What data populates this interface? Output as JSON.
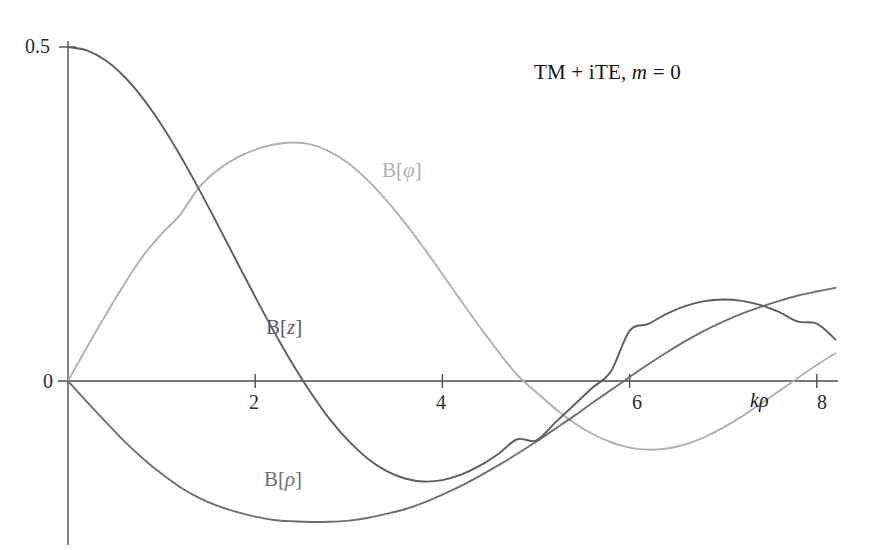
{
  "chart_data": {
    "type": "line",
    "title": "TM + iTE, m = 0",
    "title_parts": {
      "prefix": "TM + iTE,",
      "symbol": "m",
      "equals": "= 0"
    },
    "xlabel": "kρ",
    "ylabel": "",
    "xlim": [
      -0.12,
      8.2
    ],
    "ylim": [
      -0.255,
      0.52
    ],
    "grid": false,
    "legend": "inline-curve-labels",
    "x_ticks": [
      2,
      4,
      6,
      8
    ],
    "x_tick_labels": [
      "2",
      "4",
      "6",
      "8"
    ],
    "y_ticks": [
      0,
      0.5
    ],
    "y_tick_labels": [
      "0",
      "0.5"
    ],
    "x": [
      0,
      0.2,
      0.4,
      0.6,
      0.8,
      1,
      1.2,
      1.4,
      1.6,
      1.8,
      2,
      2.2,
      2.4,
      2.6,
      2.8,
      3,
      3.2,
      3.4,
      3.6,
      3.8,
      4,
      4.2,
      4.4,
      4.6,
      4.8,
      5,
      5.2,
      5.4,
      5.6,
      5.8,
      6,
      6.2,
      6.4,
      6.6,
      6.8,
      7,
      7.2,
      7.4,
      7.6,
      7.8,
      8,
      8.2
    ],
    "series": [
      {
        "name": "B[z]",
        "symbol": "z",
        "color": "#5d5d5d",
        "label_x": 3.05,
        "label_y": 0.105,
        "description": "0.5*J0(k rho)",
        "values": [
          0.5,
          0.495,
          0.4801,
          0.4558,
          0.4231,
          0.3831,
          0.3372,
          0.2869,
          0.2338,
          0.1797,
          0.126,
          0.0742,
          0.0255,
          -0.0187,
          -0.0577,
          -0.0901,
          -0.1159,
          -0.1345,
          -0.146,
          -0.1505,
          -0.1484,
          -0.1403,
          -0.1268,
          -0.1088,
          -0.0872,
          -0.0891,
          -0.063,
          -0.0367,
          -0.0105,
          0.0144,
          0.0751,
          0.0855,
          0.101,
          0.1125,
          0.1196,
          0.1221,
          0.12,
          0.1135,
          0.103,
          0.0888,
          0.0858,
          0.062
        ]
      },
      {
        "name": "B[φ]",
        "symbol": "φ",
        "color": "#b0b0b0",
        "label_x": 3.6,
        "label_y": 0.285,
        "description": "0.5*J1(k rho), peak ~0.357 at k rho ~1.84",
        "values": [
          0,
          0.0499,
          0.0985,
          0.1446,
          0.1869,
          0.2203,
          0.2492,
          0.2898,
          0.316,
          0.334,
          0.3464,
          0.354,
          0.357,
          0.3539,
          0.343,
          0.3256,
          0.3007,
          0.2708,
          0.2366,
          0.1992,
          0.16,
          0.12,
          0.0808,
          0.0435,
          0.009,
          -0.0164,
          -0.0408,
          -0.062,
          -0.079,
          -0.0917,
          -0.0997,
          -0.1028,
          -0.101,
          -0.0947,
          -0.084,
          -0.0699,
          -0.053,
          -0.0343,
          -0.0148,
          0.0048,
          0.024,
          0.0415
        ]
      },
      {
        "name": "B[ρ]",
        "symbol": "ρ",
        "color": "#6f6f6f",
        "label_x": 2.55,
        "label_y": -0.185,
        "description": "-0.5*J1(k rho)-like, min ~-0.211 at k rho ~2.9",
        "values": [
          0,
          -0.031,
          -0.0608,
          -0.09,
          -0.116,
          -0.139,
          -0.159,
          -0.175,
          -0.187,
          -0.196,
          -0.203,
          -0.208,
          -0.21,
          -0.211,
          -0.2108,
          -0.209,
          -0.205,
          -0.199,
          -0.192,
          -0.182,
          -0.17,
          -0.157,
          -0.142,
          -0.126,
          -0.109,
          -0.091,
          -0.072,
          -0.053,
          -0.033,
          -0.0135,
          0.006,
          0.025,
          0.043,
          0.06,
          0.0755,
          0.089,
          0.101,
          0.111,
          0.12,
          0.128,
          0.134,
          0.1395
        ]
      }
    ]
  },
  "axes": {
    "x_axis_label": "kρ",
    "y_tick_top": "0.5",
    "y_tick_origin": "0"
  },
  "labels": {
    "tick_2": "2",
    "tick_4": "4",
    "tick_6": "6",
    "tick_8": "8",
    "series_bz_open": "B[",
    "series_bz_sym": "z",
    "series_bz_close": "]",
    "series_bphi_open": "B[",
    "series_bphi_sym": "φ",
    "series_bphi_close": "]",
    "series_brho_open": "B[",
    "series_brho_sym": "ρ",
    "series_brho_close": "]",
    "axis_k": "k",
    "axis_rho": "ρ"
  },
  "colors": {
    "background": "#ffffff",
    "axis": "#4a4a4a",
    "bz": "#5d5d5d",
    "bphi": "#b0b0b0",
    "brho": "#6f6f6f",
    "text": "#1c1c1c"
  }
}
